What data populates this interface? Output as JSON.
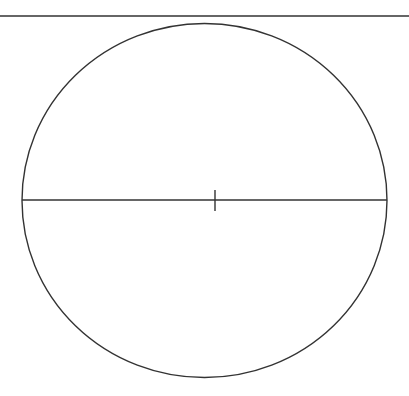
{
  "diagram": {
    "type": "circle-with-diameter",
    "stroke_color": "#333333",
    "background": "#ffffff",
    "top_rule": {
      "x1": 0,
      "y1": 16,
      "x2": 409,
      "y2": 16
    },
    "circle": {
      "cx": 204.5,
      "cy": 200.5,
      "rx": 182.5,
      "ry": 177
    },
    "diameter": {
      "x1": 22,
      "y1": 200,
      "x2": 387,
      "y2": 200
    },
    "center_tick": {
      "x": 215,
      "y1": 190,
      "y2": 211
    }
  }
}
